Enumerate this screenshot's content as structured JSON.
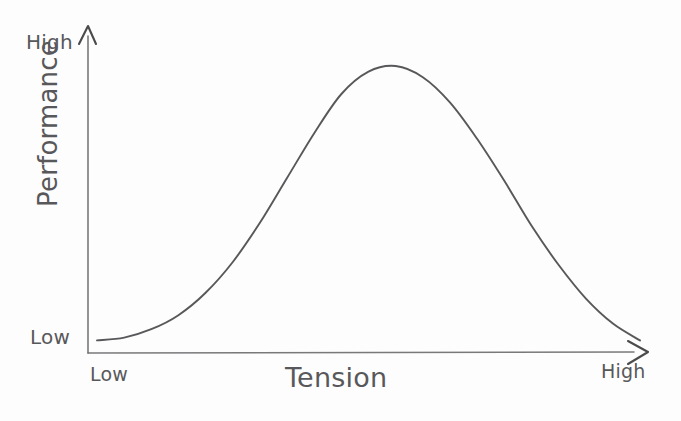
{
  "chart_data": {
    "type": "line",
    "title": "",
    "subtitle": "",
    "xlabel": "Tension",
    "ylabel": "Performance",
    "xtick_labels": [
      "Low",
      "High"
    ],
    "ytick_labels": [
      "Low",
      "High"
    ],
    "xlim": [
      "Low",
      "High"
    ],
    "ylim": [
      "Low",
      "High"
    ],
    "grid": false,
    "legend": "none",
    "style": "hand-drawn sketch, inverted-U (Yerkes-Dodson) curve",
    "line_color": "#4f4f52",
    "axis_color": "#6e6e70",
    "background_color": "#fdfdfd",
    "annotations": [],
    "series": [
      {
        "name": "Performance",
        "x": [
          0.0,
          0.05,
          0.1,
          0.15,
          0.2,
          0.25,
          0.3,
          0.35,
          0.4,
          0.45,
          0.5,
          0.55,
          0.6,
          0.65,
          0.7,
          0.75,
          0.8,
          0.85,
          0.9,
          0.95,
          1.0
        ],
        "values": [
          0.02,
          0.03,
          0.06,
          0.11,
          0.19,
          0.3,
          0.44,
          0.6,
          0.76,
          0.9,
          0.98,
          1.0,
          0.96,
          0.87,
          0.74,
          0.59,
          0.43,
          0.29,
          0.17,
          0.08,
          0.02
        ],
        "peak_x": 0.55,
        "peak_y": 1.0
      }
    ]
  },
  "axes": {
    "y_top_label": "High",
    "y_bottom_label": "Low",
    "y_title": "Performance",
    "x_left_label": "Low",
    "x_right_label": "High",
    "x_title": "Tension"
  },
  "icons": {
    "y_arrow": "arrow-up-icon",
    "x_arrow": "arrow-right-icon"
  }
}
